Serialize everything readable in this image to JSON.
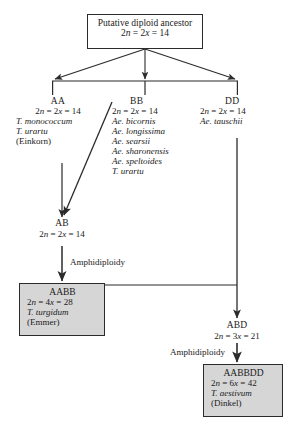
{
  "diagram": {
    "ancestor": {
      "name": "putative-diploid-ancestor",
      "line1": "Putative diploid ancestor",
      "line2_2n": "2",
      "line2_n": "n",
      "line2_eq1": " = 2",
      "line2_x": "x",
      "line2_eq2": " = 14",
      "formula": "2n = 2x = 14"
    },
    "genomes": [
      {
        "name": "genome-aa",
        "header": "AA",
        "formula": "2n = 2x = 14",
        "species": [
          "T. monococcum",
          "T. urartu"
        ],
        "common": "(Einkorn)"
      },
      {
        "name": "genome-bb",
        "header": "BB",
        "formula": "2n = 2x = 14",
        "species": [
          "Ae. bicornis",
          "Ae. longissima",
          "Ae. searsii",
          "Ae. sharonensis",
          "Ae. speltoides",
          "T. urartu"
        ],
        "common": ""
      },
      {
        "name": "genome-dd",
        "header": "DD",
        "formula": "2n = 2x = 14",
        "species": [
          "Ae. tauschii"
        ],
        "common": ""
      }
    ],
    "hybrids": [
      {
        "name": "hybrid-ab",
        "header": "AB",
        "formula": "2n = 2x = 14"
      },
      {
        "name": "hybrid-abd",
        "header": "ABD",
        "formula": "2n = 3x = 21"
      }
    ],
    "polyploids": [
      {
        "name": "polyploid-aabb",
        "header": "AABB",
        "formula": "2n = 4x = 28",
        "species": "T. turgidum",
        "common": "(Emmer)"
      },
      {
        "name": "polyploid-aabbdd",
        "header": "AABBDD",
        "formula": "2n = 6x = 42",
        "species": "T. aestivum",
        "common": "(Dinkel)"
      }
    ],
    "process_labels": {
      "amphidiploidy_1": "Amphidiploidy",
      "amphidiploidy_2": "Amphidiploidy"
    },
    "colors": {
      "line": "#2b2b2b",
      "box_fill_gray": "#d6d6d6",
      "box_fill_white": "#ffffff",
      "text": "#1a1a1a",
      "background": "#ffffff"
    }
  }
}
